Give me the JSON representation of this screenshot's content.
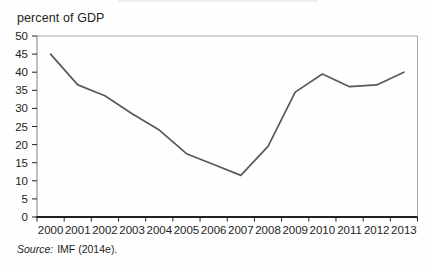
{
  "figure": {
    "unit_label": "percent of GDP",
    "source": {
      "label": "Source:",
      "text": "IMF (2014e)."
    }
  },
  "chart_data": {
    "type": "line",
    "x": [
      2000,
      2001,
      2002,
      2003,
      2004,
      2005,
      2006,
      2007,
      2008,
      2009,
      2010,
      2011,
      2012,
      2013
    ],
    "values": [
      45,
      36.5,
      33.5,
      28.5,
      24,
      17.5,
      14.5,
      11.5,
      19.5,
      34.5,
      39.5,
      36,
      36.5,
      40
    ],
    "title": "",
    "xlabel": "",
    "ylabel": "percent of GDP",
    "ylim": [
      0,
      50
    ],
    "ytick_step": 5,
    "grid": false,
    "legend": "none",
    "colors": {
      "line": "#58595b",
      "axis": "#231f20",
      "border": "#a7a9ac",
      "text": "#231f20"
    }
  }
}
